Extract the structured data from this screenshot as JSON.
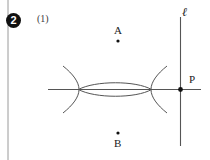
{
  "figure": {
    "problem_number": "2",
    "sub_number": "(1)",
    "stroke_color": "#555555",
    "point_color": "#111111",
    "border_color": "#9a9a9a",
    "background": "#ffffff"
  },
  "points": [
    {
      "id": "A",
      "label": "A",
      "x": 118,
      "y": 41,
      "label_position": "above"
    },
    {
      "id": "B",
      "label": "B",
      "x": 118,
      "y": 138,
      "label_position": "below"
    },
    {
      "id": "P",
      "label": "P",
      "x": 180,
      "y": 89,
      "label_position": "upper-right"
    }
  ],
  "lines": [
    {
      "id": "horizontal",
      "label": "",
      "x1": 48,
      "y1": 89,
      "x2": 201,
      "y2": 89
    },
    {
      "id": "vertical",
      "label": "ℓ",
      "x1": 180,
      "y1": 17,
      "x2": 180,
      "y2": 146
    },
    {
      "id": "left-border",
      "label": "",
      "x1": 8,
      "y1": 0,
      "x2": 8,
      "y2": 160
    }
  ],
  "arcs": {
    "left_intersection": {
      "x": 78,
      "y": 89
    },
    "right_intersection": {
      "x": 152,
      "y": 89
    },
    "lens_half_height": 7,
    "upper_arc": "M 64 68 Q 78 89 64 110",
    "lower_arc": "M 166 68 Q 152 89 166 110",
    "lens_top": "M 78 89 Q 115 80 152 89",
    "lens_bottom": "M 78 89 Q 115 98 152 89"
  },
  "labels": {
    "line_l": "ℓ",
    "point_a": "A",
    "point_b": "B",
    "point_p": "P"
  }
}
